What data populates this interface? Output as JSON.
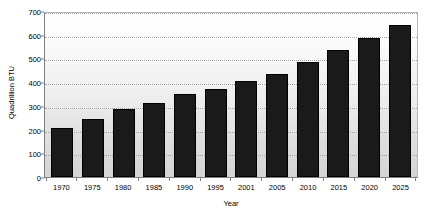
{
  "chart_data": {
    "type": "bar",
    "title": "",
    "xlabel": "Year",
    "ylabel": "Quadrillion BTU",
    "categories": [
      "1970",
      "1975",
      "1980",
      "1985",
      "1990",
      "1995",
      "2001",
      "2005",
      "2010",
      "2015",
      "2020",
      "2025"
    ],
    "values": [
      207,
      243,
      288,
      312,
      350,
      371,
      406,
      434,
      483,
      535,
      588,
      642
    ],
    "ylim": [
      0,
      700
    ],
    "ytick_labels": [
      "0",
      "100",
      "200",
      "300",
      "400",
      "500",
      "600",
      "700"
    ],
    "ytick_values": [
      0,
      100,
      200,
      300,
      400,
      500,
      600,
      700
    ],
    "grid": true,
    "grid_orientation": "horizontal",
    "legend": null,
    "legend_position": "none",
    "series": [
      {
        "name": "Quadrillion BTU",
        "values": [
          207,
          243,
          288,
          312,
          350,
          371,
          406,
          434,
          483,
          535,
          588,
          642
        ]
      }
    ],
    "colors": {
      "bar": "#1a1a1a",
      "bar_border": "#000000",
      "plot_background_top": "#ffffff",
      "plot_background_bottom": "#d4d4d4",
      "gridline": "#9a9a9a",
      "axis": "#808080",
      "text": "#000000",
      "page_background": "#ffffff"
    }
  }
}
